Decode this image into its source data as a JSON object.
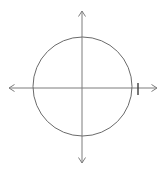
{
  "figure": {
    "title": "Circle centered at the origin on a coordinate plane",
    "background_color": "#ffffff",
    "width": 164,
    "height": 171,
    "axis_color": "#7d7d7d",
    "circle_color": "#6b6b6b",
    "tick_color": "#3c3c3c"
  },
  "chart_data": {
    "type": "scatter",
    "title": "",
    "subtitle": "",
    "xlabel": "",
    "ylabel": "",
    "xlim": [
      -1.5,
      1.5
    ],
    "ylim": [
      -1.55,
      1.55
    ],
    "grid": false,
    "legend": null,
    "tick_labels": {
      "x": [],
      "y": []
    },
    "shapes": [
      {
        "kind": "circle",
        "center_x": 0,
        "center_y": 0,
        "radius": 1,
        "filled": false,
        "stroke": "#6b6b6b"
      }
    ],
    "axes": [
      {
        "name": "x-axis",
        "orientation": "horizontal",
        "arrow_start": true,
        "arrow_end": true,
        "pixel_y": 88,
        "pixel_x_start": 9,
        "pixel_x_end": 157
      },
      {
        "name": "y-axis",
        "orientation": "vertical",
        "arrow_start": true,
        "arrow_end": true,
        "pixel_x": 82,
        "pixel_y_start": 11,
        "pixel_y_end": 163
      }
    ],
    "ticks": [
      {
        "axis": "x",
        "label": "",
        "pixel_x": 138,
        "pixel_y_top": 83,
        "pixel_y_bottom": 95
      }
    ],
    "annotations": [],
    "series": [],
    "values": [],
    "categories": []
  }
}
